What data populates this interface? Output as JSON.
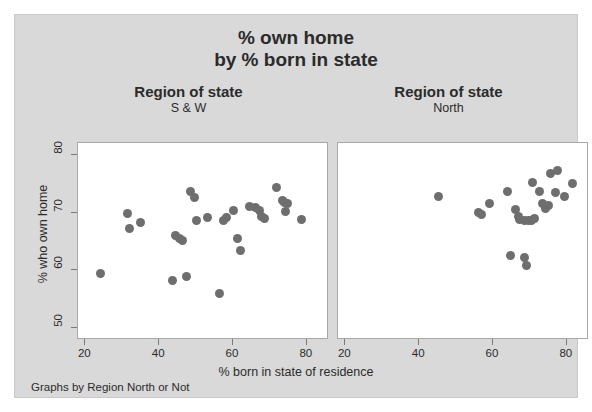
{
  "chart_data": {
    "type": "scatter",
    "title": "% own home\nby % born in state",
    "title_lines": [
      "% own home",
      "by % born in state"
    ],
    "xlabel": "% born in state of residence",
    "ylabel": "% who own home",
    "footnote": "Graphs by Region North or Not",
    "grid": false,
    "legend": "none",
    "marker_color": "#6e6e6e",
    "background_color": "#d9d9d9",
    "panel_background_color": "#ffffff",
    "xlim": [
      18,
      86
    ],
    "ylim": [
      48,
      82
    ],
    "xticks": [
      20,
      40,
      60,
      80
    ],
    "yticks": [
      50,
      60,
      70,
      80
    ],
    "panels": [
      {
        "header": "Region of state",
        "subheader": "S & W",
        "points": [
          {
            "x": 24.2,
            "y": 59.4
          },
          {
            "x": 31.5,
            "y": 69.8
          },
          {
            "x": 32.0,
            "y": 67.2
          },
          {
            "x": 35.0,
            "y": 68.2
          },
          {
            "x": 43.6,
            "y": 58.3
          },
          {
            "x": 44.4,
            "y": 66.0
          },
          {
            "x": 45.4,
            "y": 65.6
          },
          {
            "x": 46.2,
            "y": 65.2
          },
          {
            "x": 47.4,
            "y": 59.0
          },
          {
            "x": 48.6,
            "y": 73.6
          },
          {
            "x": 49.6,
            "y": 72.6
          },
          {
            "x": 50.2,
            "y": 68.6
          },
          {
            "x": 53.0,
            "y": 69.2
          },
          {
            "x": 56.4,
            "y": 56.1
          },
          {
            "x": 57.4,
            "y": 68.6
          },
          {
            "x": 58.2,
            "y": 69.2
          },
          {
            "x": 60.0,
            "y": 70.4
          },
          {
            "x": 61.2,
            "y": 65.5
          },
          {
            "x": 62.0,
            "y": 63.4
          },
          {
            "x": 64.5,
            "y": 71.0
          },
          {
            "x": 66.2,
            "y": 70.8
          },
          {
            "x": 67.2,
            "y": 70.3
          },
          {
            "x": 67.8,
            "y": 69.4
          },
          {
            "x": 68.4,
            "y": 69.0
          },
          {
            "x": 71.8,
            "y": 74.4
          },
          {
            "x": 73.4,
            "y": 72.0
          },
          {
            "x": 74.0,
            "y": 71.8
          },
          {
            "x": 74.8,
            "y": 71.6
          },
          {
            "x": 74.2,
            "y": 70.2
          },
          {
            "x": 78.6,
            "y": 68.8
          }
        ]
      },
      {
        "header": "Region of state",
        "subheader": "North",
        "points": [
          {
            "x": 45.2,
            "y": 72.8
          },
          {
            "x": 56.0,
            "y": 70.0
          },
          {
            "x": 57.0,
            "y": 69.6
          },
          {
            "x": 59.0,
            "y": 71.6
          },
          {
            "x": 63.8,
            "y": 73.6
          },
          {
            "x": 64.6,
            "y": 62.6
          },
          {
            "x": 66.0,
            "y": 70.6
          },
          {
            "x": 66.8,
            "y": 69.4
          },
          {
            "x": 67.2,
            "y": 68.8
          },
          {
            "x": 68.4,
            "y": 68.6
          },
          {
            "x": 68.6,
            "y": 62.2
          },
          {
            "x": 69.0,
            "y": 60.8
          },
          {
            "x": 69.6,
            "y": 68.6
          },
          {
            "x": 70.4,
            "y": 68.7
          },
          {
            "x": 70.8,
            "y": 75.2
          },
          {
            "x": 71.2,
            "y": 69.0
          },
          {
            "x": 72.6,
            "y": 73.6
          },
          {
            "x": 73.4,
            "y": 71.6
          },
          {
            "x": 74.2,
            "y": 70.7
          },
          {
            "x": 75.0,
            "y": 71.2
          },
          {
            "x": 75.6,
            "y": 76.8
          },
          {
            "x": 76.8,
            "y": 73.4
          },
          {
            "x": 77.6,
            "y": 77.2
          },
          {
            "x": 79.4,
            "y": 72.8
          },
          {
            "x": 81.6,
            "y": 75.0
          }
        ]
      }
    ]
  }
}
